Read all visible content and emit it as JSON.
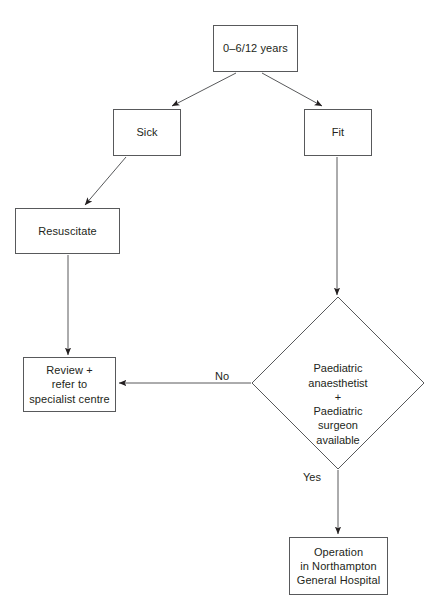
{
  "diagram": {
    "type": "flowchart",
    "stroke_color": "#58595b",
    "text_color": "#231f20",
    "background": "#ffffff",
    "nodes": [
      {
        "id": "age",
        "shape": "rect",
        "text": "0–6/12 years",
        "x": 213,
        "y": 25,
        "w": 85,
        "h": 47
      },
      {
        "id": "sick",
        "shape": "rect",
        "text": "Sick",
        "x": 113,
        "y": 109,
        "w": 68,
        "h": 47
      },
      {
        "id": "fit",
        "shape": "rect",
        "text": "Fit",
        "x": 304,
        "y": 109,
        "w": 68,
        "h": 47
      },
      {
        "id": "resuscitate",
        "shape": "rect",
        "text": "Resuscitate",
        "x": 15,
        "y": 208,
        "w": 105,
        "h": 46
      },
      {
        "id": "review",
        "shape": "rect",
        "text": "Review +\nrefer to\nspecialist centre",
        "x": 23,
        "y": 357,
        "w": 93,
        "h": 55
      },
      {
        "id": "decision",
        "shape": "diamond",
        "text": "Paediatric\nanaesthetist\n+\nPaediatric\nsurgeon\navailable",
        "cx": 338,
        "cy": 383,
        "rx": 86,
        "ry": 86
      },
      {
        "id": "operation",
        "shape": "rect",
        "text": "Operation\nin Northampton\nGeneral Hospital",
        "x": 289,
        "y": 537,
        "w": 99,
        "h": 58
      }
    ],
    "edges": [
      {
        "id": "age-to-sick",
        "from": "age",
        "to": "sick",
        "label": ""
      },
      {
        "id": "age-to-fit",
        "from": "age",
        "to": "fit",
        "label": ""
      },
      {
        "id": "sick-to-resuscitate",
        "from": "sick",
        "to": "resuscitate",
        "label": ""
      },
      {
        "id": "resuscitate-to-review",
        "from": "resuscitate",
        "to": "review",
        "label": ""
      },
      {
        "id": "fit-to-decision",
        "from": "fit",
        "to": "decision",
        "label": ""
      },
      {
        "id": "decision-to-review",
        "from": "decision",
        "to": "review",
        "label": "No",
        "label_x": 215,
        "label_y": 370
      },
      {
        "id": "decision-to-operation",
        "from": "decision",
        "to": "operation",
        "label": "Yes",
        "label_x": 303,
        "label_y": 471
      }
    ]
  }
}
